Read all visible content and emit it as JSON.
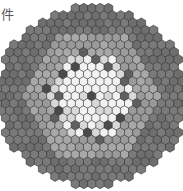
{
  "image": {
    "title": "Hexagonal reactor core cross-section",
    "width": 183,
    "height": 191,
    "background": "#ffffff"
  },
  "annotation": {
    "fragment_text": "件",
    "color": "#5a5a5a"
  },
  "palette": {
    "outer_ring_dark": "#6e6e6e",
    "outer_ring_dark2": "#7a7a7a",
    "mid_ring_gray": "#9a9a9a",
    "mid_ring_gray2": "#a8a8a8",
    "inner_light": "#d8d8d8",
    "inner_white": "#f2f2f2",
    "control_rod": "#5f5f5f",
    "control_rod_dark": "#4a4a4a",
    "outline": "#3a3a3a",
    "background": "#ffffff"
  },
  "legend_names": {
    "outer": "shield-reflector-assembly",
    "mid": "blanket-assembly",
    "inner": "fuel-assembly",
    "rod": "control-rod-assembly"
  },
  "lattice": {
    "orientation": "flat-top-hex",
    "cell_width": 8.2,
    "cell_height": 7.3,
    "center_x": 92,
    "center_y": 96,
    "rings": 13,
    "ring_bands": [
      {
        "from": 0,
        "to": 5,
        "zone": "inner"
      },
      {
        "from": 6,
        "to": 8,
        "zone": "mid"
      },
      {
        "from": 9,
        "to": 13,
        "zone": "outer"
      }
    ],
    "radius_limit": 95
  },
  "chart_data": {
    "type": "heatmap",
    "xlabel": "",
    "ylabel": "",
    "categories": [
      "fuel-assembly",
      "blanket-assembly",
      "shield-reflector-assembly",
      "control-rod-assembly"
    ],
    "values": [
      271,
      198,
      246,
      19
    ],
    "control_rod_axial_coords": [
      [
        0,
        0
      ],
      [
        0,
        -4
      ],
      [
        0,
        4
      ],
      [
        -4,
        0
      ],
      [
        4,
        0
      ],
      [
        -4,
        4
      ],
      [
        4,
        -4
      ],
      [
        -2,
        -3
      ],
      [
        2,
        3
      ],
      [
        3,
        -5
      ],
      [
        -3,
        5
      ],
      [
        -5,
        2
      ],
      [
        5,
        -2
      ],
      [
        -2,
        6
      ],
      [
        2,
        -6
      ],
      [
        6,
        -3
      ],
      [
        -6,
        3
      ],
      [
        -5,
        -1
      ],
      [
        5,
        1
      ]
    ]
  }
}
